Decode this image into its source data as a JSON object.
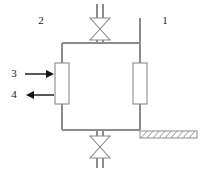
{
  "diagram": {
    "kind": "process-flow-diagram",
    "background_color": "#ffffff",
    "line_color": "#8c8c8c",
    "arrow_color": "#111111",
    "label_color": "#1a1a1a"
  },
  "labels": {
    "column_right": "1",
    "column_left": "2",
    "inlet_stream": "3",
    "outlet_stream": "4"
  },
  "components": {
    "top_valve": {
      "name": "top-valve",
      "type": "gate-valve",
      "symbol": "bowtie"
    },
    "bottom_valve": {
      "name": "bottom-valve",
      "type": "gate-valve",
      "symbol": "bowtie"
    },
    "left_vessel": {
      "name": "left-column",
      "type": "packed-column"
    },
    "right_vessel": {
      "name": "right-column",
      "type": "packed-column"
    },
    "ground_support": {
      "name": "ground-support",
      "type": "hatched-anchor"
    }
  },
  "streams": [
    {
      "id": "3",
      "direction": "inlet",
      "arrow": "right"
    },
    {
      "id": "4",
      "direction": "outlet",
      "arrow": "left"
    }
  ],
  "geometry": {
    "left_pipe_x": 62,
    "right_pipe_x": 140,
    "top_pipe_y": 43,
    "bottom_pipe_y": 130,
    "valve_x": 100
  }
}
